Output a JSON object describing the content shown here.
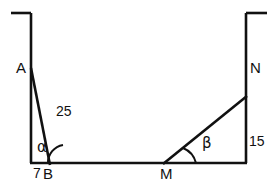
{
  "figure": {
    "stroke_color": "#111111",
    "background_color": "#ffffff",
    "vertices": [
      {
        "id": "A",
        "label": "A",
        "x": 31,
        "y": 68
      },
      {
        "id": "B",
        "label": "B",
        "x": 48,
        "y": 163
      },
      {
        "id": "M",
        "label": "M",
        "x": 164,
        "y": 163
      },
      {
        "id": "N",
        "label": "N",
        "x": 246,
        "y": 96
      }
    ],
    "measures": [
      {
        "id": "AB",
        "label": "25",
        "x": 56,
        "y": 104
      },
      {
        "id": "N-wall",
        "label": "15",
        "x": 249,
        "y": 134
      },
      {
        "id": "base-left",
        "label": "7",
        "x": 33,
        "y": 166
      }
    ],
    "angles": [
      {
        "id": "alpha",
        "label": "α",
        "vertex": "B",
        "x": 37,
        "y": 140
      },
      {
        "id": "beta",
        "label": "β",
        "vertex": "M",
        "x": 202,
        "y": 136
      }
    ]
  }
}
